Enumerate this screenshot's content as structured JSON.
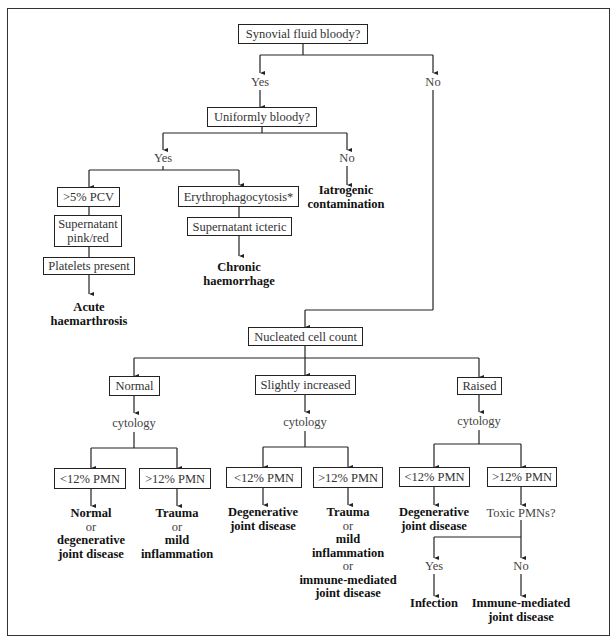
{
  "diagram": {
    "title_node": "Synovial fluid bloody?",
    "level1": {
      "yes": "Yes",
      "no": "No"
    },
    "bloody_branch": {
      "question": "Uniformly bloody?",
      "yes": "Yes",
      "no": "No",
      "no_outcome": [
        "Iatrogenic",
        "contamination"
      ],
      "left_chain": {
        "pcv": ">5% PCV",
        "supernatant": [
          "Supernatant",
          "pink/red"
        ],
        "platelets": "Platelets present",
        "outcome": [
          "Acute",
          "haemarthrosis"
        ]
      },
      "right_chain": {
        "erythro": "Erythrophagocytosis*",
        "supernatant": "Supernatant icteric",
        "outcome": [
          "Chronic",
          "haemorrhage"
        ]
      }
    },
    "nonbloody_branch": {
      "question": "Nucleated cell count",
      "columns": [
        {
          "label": "Normal",
          "cytology": "cytology",
          "low_pmn": "<12% PMN",
          "high_pmn": ">12% PMN",
          "low_outcome": [
            "Normal",
            "or",
            "degenerative",
            "joint disease"
          ],
          "high_outcome": [
            "Trauma",
            "or",
            "mild",
            "inflammation"
          ]
        },
        {
          "label": "Slightly increased",
          "cytology": "cytology",
          "low_pmn": "<12% PMN",
          "high_pmn": ">12% PMN",
          "low_outcome": [
            "Degenerative",
            "joint disease"
          ],
          "high_outcome": [
            "Trauma",
            "or",
            "mild",
            "inflammation",
            "or",
            "immune-mediated",
            "joint disease"
          ]
        },
        {
          "label": "Raised",
          "cytology": "cytology",
          "low_pmn": "<12% PMN",
          "high_pmn": ">12% PMN",
          "low_outcome": [
            "Degenerative",
            "joint disease"
          ],
          "high_question": "Toxic PMNs?",
          "toxic_yes": "Yes",
          "toxic_no": "No",
          "yes_outcome": [
            "Infection"
          ],
          "no_outcome": [
            "Immune-mediated",
            "joint disease"
          ]
        }
      ]
    }
  }
}
